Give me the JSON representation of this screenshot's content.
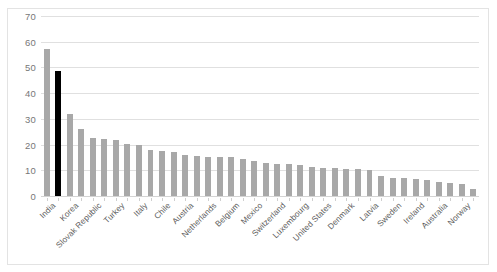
{
  "chart_data": {
    "type": "bar",
    "title": "",
    "subtitle": "",
    "xlabel": "",
    "ylabel": "",
    "ylim": [
      0,
      70
    ],
    "ytick_values": [
      0,
      10,
      20,
      30,
      40,
      50,
      60,
      70
    ],
    "ytick_labels": [
      "0",
      "10",
      "20",
      "30",
      "40",
      "50",
      "60",
      "70"
    ],
    "grid": "horizontal",
    "legend": "none",
    "bar_color": "#a8a8a8",
    "highlight_color": "#000000",
    "highlighted_category": "Korea",
    "label_rotation": -45,
    "labeled_every_nth": 2,
    "categories": [
      "India",
      "",
      "Korea",
      "",
      "Slovak Republic",
      "",
      "Turkey",
      "",
      "Italy",
      "",
      "Chile",
      "",
      "Austria",
      "",
      "Netherlands",
      "",
      "Belgium",
      "",
      "Mexico",
      "",
      "Switzerland",
      "",
      "Luxembourg",
      "",
      "United States",
      "",
      "Denmark",
      "",
      "Latvia",
      "",
      "Sweden",
      "",
      "Ireland",
      "",
      "Australia",
      "",
      "Norway",
      ""
    ],
    "visible_tick_labels": [
      "India",
      "Korea",
      "Slovak Republic",
      "Turkey",
      "Italy",
      "Chile",
      "Austria",
      "Netherlands",
      "Belgium",
      "Mexico",
      "Switzerland",
      "Luxembourg",
      "United States",
      "Denmark",
      "Latvia",
      "Sweden",
      "Ireland",
      "Australia",
      "Norway"
    ],
    "values": [
      57.0,
      48.8,
      31.8,
      26.0,
      22.4,
      22.2,
      21.7,
      20.3,
      20.0,
      17.8,
      17.4,
      17.2,
      16.0,
      15.6,
      15.2,
      15.1,
      15.0,
      14.5,
      13.5,
      12.8,
      12.5,
      12.4,
      11.9,
      11.3,
      11.0,
      10.8,
      10.7,
      10.7,
      10.1,
      7.7,
      7.1,
      7.1,
      6.6,
      6.3,
      5.4,
      4.9,
      4.6,
      2.9
    ],
    "highlight_index": 1
  }
}
